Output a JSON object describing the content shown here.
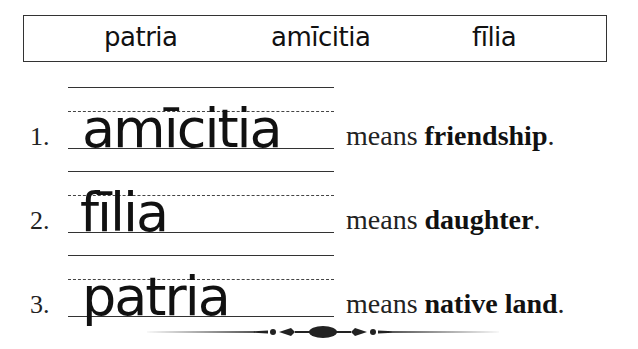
{
  "word_bank": {
    "words": [
      "patria",
      "amīcitia",
      "fīlia"
    ]
  },
  "exercises": [
    {
      "number": "1.",
      "latin": "amīcitia",
      "means_label": "means",
      "english": "friendship",
      "period": "."
    },
    {
      "number": "2.",
      "latin": "fīlia",
      "means_label": "means",
      "english": "daughter",
      "period": "."
    },
    {
      "number": "3.",
      "latin": "patria",
      "means_label": "means",
      "english": "native land",
      "period": "."
    }
  ],
  "decorations": {
    "divider_icon": "ornamental-divider-icon"
  }
}
